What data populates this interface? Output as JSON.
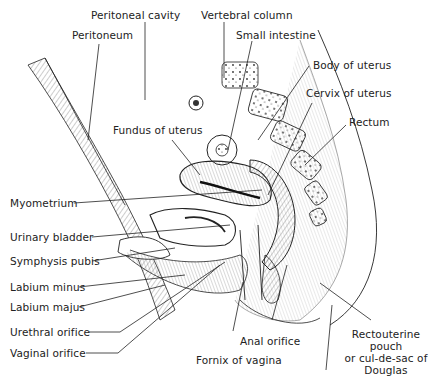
{
  "figure": {
    "labels": {
      "peritoneal_cavity": "Peritoneal cavity",
      "vertebral_column": "Vertebral column",
      "peritoneum": "Peritoneum",
      "small_intestine": "Small intestine",
      "body_of_uterus": "Body of uterus",
      "cervix_of_uterus": "Cervix of uterus",
      "rectum": "Rectum",
      "fundus_of_uterus": "Fundus of uterus",
      "myometrium": "Myometrium",
      "urinary_bladder": "Urinary bladder",
      "symphysis_pubis": "Symphysis pubis",
      "labium_minus": "Labium minus",
      "labium_majus": "Labium majus",
      "urethral_orifice": "Urethral orifice",
      "vaginal_orifice": "Vaginal orifice",
      "anal_orifice": "Anal orifice",
      "fornix_of_vagina": "Fornix of vagina",
      "rectouterine_pouch_1": "Rectouterine pouch",
      "rectouterine_pouch_2": "or cul-de-sac of",
      "rectouterine_pouch_3": "Douglas"
    },
    "colors": {
      "ink": "#222222",
      "background": "#ffffff"
    }
  }
}
